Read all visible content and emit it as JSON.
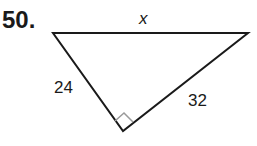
{
  "problem": {
    "number": "50.",
    "figure": "right-triangle",
    "labels": {
      "hypotenuse": "x",
      "left_leg": "24",
      "right_leg": "32"
    },
    "right_angle_marker": "bottom-vertex"
  }
}
